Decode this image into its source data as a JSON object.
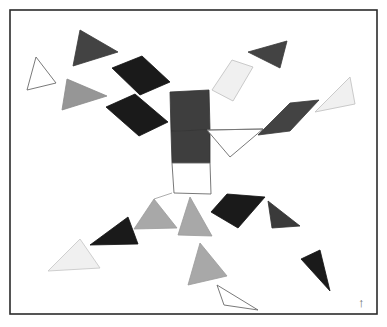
{
  "figure": {
    "title": "",
    "background_color": "#ffffff",
    "border": {
      "name": "figure-border",
      "x": 10,
      "y": 10,
      "width": 367,
      "height": 304,
      "stroke": "#2b2b2b",
      "stroke_width": 1.6,
      "fill": "none"
    },
    "orientation_marker": {
      "name": "north-arrow",
      "glyph": "↑",
      "x": 358,
      "y": 296,
      "color": "#6b6b6b"
    },
    "palette": {
      "black": "#1a1a1a",
      "very_dark_gray": "#2e2e2e",
      "dark_gray": "#434343",
      "mid_dark_gray": "#3e3e3e",
      "mid_gray": "#969696",
      "light_gray": "#c8c8c8",
      "near_white": "#f0f0f0",
      "white": "#ffffff",
      "outline": "#555555",
      "thin_line": "#777777"
    },
    "shapes": [
      {
        "name": "triangle-outline-upper-left",
        "kind": "triangle",
        "points": "27,90 36,57 56,83",
        "fill": "#ffffff",
        "stroke": "#6a6a6a",
        "stroke_width": 0.9
      },
      {
        "name": "triangle-dark-top-left",
        "kind": "triangle",
        "points": "73,66 80,30 118,52",
        "fill": "#434343",
        "stroke": "#3a3a3a",
        "stroke_width": 0.8
      },
      {
        "name": "triangle-mid-gray-left",
        "kind": "triangle",
        "points": "62,110 67,79 107,96",
        "fill": "#969696",
        "stroke": "#8a8a8a",
        "stroke_width": 0.8
      },
      {
        "name": "parallelogram-black-upper-left",
        "kind": "quad",
        "points": "112,68 142,56 170,82 140,95",
        "fill": "#1a1a1a",
        "stroke": "#111111",
        "stroke_width": 0.8
      },
      {
        "name": "parallelogram-black-left",
        "kind": "quad",
        "points": "106,107 135,94 168,122 139,136",
        "fill": "#1a1a1a",
        "stroke": "#111111",
        "stroke_width": 0.8
      },
      {
        "name": "square-dark-center-upper",
        "kind": "quad",
        "points": "170,92 209,90 210,130 171,131",
        "fill": "#3e3e3e",
        "stroke": "#333333",
        "stroke_width": 0.8
      },
      {
        "name": "square-dark-center-lower",
        "kind": "quad",
        "points": "171,131 210,130 210,163 172,163",
        "fill": "#3e3e3e",
        "stroke": "#333333",
        "stroke_width": 0.8
      },
      {
        "name": "square-white-center-bottom",
        "kind": "quad",
        "points": "172,163 210,163 211,194 174,193",
        "fill": "#ffffff",
        "stroke": "#6a6a6a",
        "stroke_width": 0.9
      },
      {
        "name": "triangle-outline-center-right",
        "kind": "triangle",
        "points": "207,130 263,129 230,157",
        "fill": "#ffffff",
        "stroke": "#6a6a6a",
        "stroke_width": 0.9
      },
      {
        "name": "parallelogram-near-white-top",
        "kind": "quad",
        "points": "212,90 232,60 253,67 233,101",
        "fill": "#f0f0f0",
        "stroke": "#c4c4c4",
        "stroke_width": 0.9
      },
      {
        "name": "triangle-dark-top-right",
        "kind": "triangle",
        "points": "248,52 287,41 280,68",
        "fill": "#434343",
        "stroke": "#3a3a3a",
        "stroke_width": 0.8
      },
      {
        "name": "parallelogram-dark-right",
        "kind": "quad",
        "points": "258,135 290,103 319,100 290,131",
        "fill": "#434343",
        "stroke": "#3a3a3a",
        "stroke_width": 0.8
      },
      {
        "name": "triangle-near-white-right",
        "kind": "triangle",
        "points": "315,112 350,77 355,104",
        "fill": "#f0f0f0",
        "stroke": "#c4c4c4",
        "stroke_width": 0.9
      },
      {
        "name": "triangle-mid-gray-bottom-center-left",
        "kind": "triangle",
        "points": "134,229 154,199 177,228",
        "fill": "#a8a8a8",
        "stroke": "#9a9a9a",
        "stroke_width": 0.8
      },
      {
        "name": "triangle-mid-gray-bottom-center",
        "kind": "triangle",
        "points": "178,235 190,197 212,236",
        "fill": "#a8a8a8",
        "stroke": "#9a9a9a",
        "stroke_width": 0.8
      },
      {
        "name": "triangle-black-bottom-left",
        "kind": "triangle",
        "points": "90,245 128,217 138,244",
        "fill": "#1a1a1a",
        "stroke": "#111111",
        "stroke_width": 0.8
      },
      {
        "name": "triangle-near-white-bottom-left",
        "kind": "triangle",
        "points": "48,271 80,239 100,268",
        "fill": "#f0f0f0",
        "stroke": "#c9c9c9",
        "stroke_width": 0.9
      },
      {
        "name": "parallelogram-black-bottom-right",
        "kind": "quad",
        "points": "211,212 227,194 265,197 238,228",
        "fill": "#1a1a1a",
        "stroke": "#111111",
        "stroke_width": 0.8
      },
      {
        "name": "triangle-dark-bottom-right",
        "kind": "triangle",
        "points": "272,228 268,201 300,226",
        "fill": "#3a3a3a",
        "stroke": "#313131",
        "stroke_width": 0.8
      },
      {
        "name": "triangle-mid-gray-bottom",
        "kind": "triangle",
        "points": "188,285 200,243 227,276",
        "fill": "#a8a8a8",
        "stroke": "#9a9a9a",
        "stroke_width": 0.8
      },
      {
        "name": "triangle-black-bottom-far-right",
        "kind": "triangle",
        "points": "301,259 320,250 330,291",
        "fill": "#1a1a1a",
        "stroke": "#111111",
        "stroke_width": 0.8
      },
      {
        "name": "triangle-outline-bottom",
        "kind": "triangle",
        "points": "217,285 224,305 258,310",
        "fill": "#ffffff",
        "stroke": "#6a6a6a",
        "stroke_width": 0.9
      }
    ],
    "connectors": [
      {
        "name": "connector-center-to-right",
        "x1": 207,
        "y1": 130,
        "x2": 263,
        "y2": 129,
        "stroke": "#777777",
        "stroke_width": 0.8
      },
      {
        "name": "connector-center-spokes",
        "x1": 172,
        "y1": 193,
        "x2": 154,
        "y2": 199,
        "stroke": "#8a8a8a",
        "stroke_width": 0.7
      }
    ]
  }
}
